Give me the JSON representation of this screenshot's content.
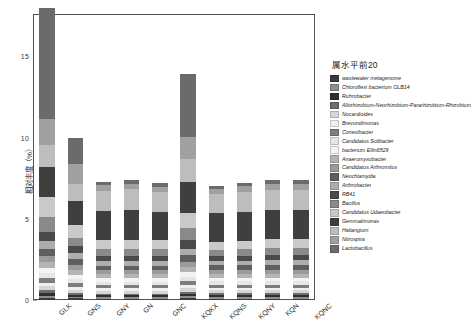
{
  "figure": {
    "background": "#ffffff",
    "frame_color": "#55524e"
  },
  "axes": {
    "y_label": "相对丰度（%）",
    "y_ticks": [
      "0",
      "5",
      "10",
      "15"
    ],
    "x_label": ""
  },
  "legend": {
    "title": "属水平前20",
    "position": "right"
  },
  "chart_data": {
    "type": "bar",
    "stacked": true,
    "title": "",
    "xlabel": "",
    "ylabel": "相对丰度（%）",
    "ylim": [
      0,
      17.6
    ],
    "yticks": [
      0,
      5,
      10,
      15
    ],
    "grid": false,
    "legend_title": "属水平前20",
    "legend_position": "right",
    "categories": [
      "GLK",
      "GNS",
      "GNY",
      "GN",
      "GNC",
      "KQKX",
      "KQNS",
      "KQNY",
      "KQN",
      "KQNC"
    ],
    "totals": [
      17.1,
      9.9,
      7.1,
      7.2,
      7.0,
      12.9,
      6.6,
      6.7,
      7.0,
      7.0
    ],
    "series": [
      {
        "name": "wastewater metagenome",
        "color": "#3a3a3a",
        "values": [
          0.12,
          0.1,
          0.08,
          0.08,
          0.08,
          0.11,
          0.09,
          0.09,
          0.09,
          0.09
        ]
      },
      {
        "name": "Chloroflexi bacterium OLB14",
        "color": "#8e8e8e",
        "values": [
          0.14,
          0.1,
          0.09,
          0.09,
          0.09,
          0.12,
          0.1,
          0.1,
          0.1,
          0.1
        ]
      },
      {
        "name": "Ruhrobacter",
        "color": "#2f2f2f",
        "values": [
          0.16,
          0.11,
          0.11,
          0.11,
          0.11,
          0.13,
          0.11,
          0.11,
          0.11,
          0.11
        ]
      },
      {
        "name": "Allorhizobium-Neorhizobium-Pararhizobium-Rhizobium",
        "color": "#6d6d6d",
        "values": [
          0.18,
          0.13,
          0.12,
          0.12,
          0.12,
          0.15,
          0.13,
          0.13,
          0.13,
          0.13
        ]
      },
      {
        "name": "Nocardioides",
        "color": "#d6d6d6",
        "values": [
          0.26,
          0.2,
          0.17,
          0.17,
          0.17,
          0.22,
          0.17,
          0.17,
          0.17,
          0.17
        ]
      },
      {
        "name": "Brevundimonas",
        "color": "#efefef",
        "values": [
          0.22,
          0.18,
          0.16,
          0.16,
          0.16,
          0.2,
          0.16,
          0.16,
          0.16,
          0.16
        ]
      },
      {
        "name": "Conexibacter",
        "color": "#7d7d7d",
        "values": [
          0.28,
          0.22,
          0.19,
          0.19,
          0.19,
          0.24,
          0.19,
          0.19,
          0.19,
          0.19
        ]
      },
      {
        "name": "Candidatus Solibacter",
        "color": "#e6e6e6",
        "values": [
          0.3,
          0.24,
          0.2,
          0.2,
          0.2,
          0.26,
          0.2,
          0.2,
          0.2,
          0.2
        ]
      },
      {
        "name": "bacterium Ellin6529",
        "color": "#f3f3f3",
        "values": [
          0.32,
          0.26,
          0.22,
          0.22,
          0.22,
          0.28,
          0.22,
          0.22,
          0.22,
          0.22
        ]
      },
      {
        "name": "Anaeromyxobacter",
        "color": "#b4b4b4",
        "values": [
          0.36,
          0.3,
          0.24,
          0.24,
          0.24,
          0.32,
          0.24,
          0.24,
          0.24,
          0.24
        ]
      },
      {
        "name": "Candidatus Arthromitus",
        "color": "#9b9b9b",
        "values": [
          0.38,
          0.32,
          0.26,
          0.26,
          0.26,
          0.34,
          0.26,
          0.26,
          0.26,
          0.26
        ]
      },
      {
        "name": "Neochlamydia",
        "color": "#5f5f5f",
        "values": [
          0.42,
          0.34,
          0.27,
          0.27,
          0.27,
          0.38,
          0.26,
          0.27,
          0.27,
          0.27
        ]
      },
      {
        "name": "Arthrobacter",
        "color": "#adadad",
        "values": [
          0.48,
          0.38,
          0.3,
          0.3,
          0.3,
          0.42,
          0.28,
          0.29,
          0.3,
          0.3
        ]
      },
      {
        "name": "RB41",
        "color": "#4a4a4a",
        "values": [
          0.6,
          0.42,
          0.32,
          0.32,
          0.32,
          0.52,
          0.3,
          0.31,
          0.32,
          0.32
        ]
      },
      {
        "name": "Bacillus",
        "color": "#8a8a8a",
        "values": [
          0.9,
          0.55,
          0.42,
          0.42,
          0.42,
          0.72,
          0.38,
          0.4,
          0.42,
          0.42
        ]
      },
      {
        "name": "Candidatus Udaeobacter",
        "color": "#c9c9c9",
        "values": [
          1.25,
          0.78,
          0.56,
          0.58,
          0.56,
          0.95,
          0.5,
          0.52,
          0.56,
          0.56
        ]
      },
      {
        "name": "Gemmatimonas",
        "color": "#3f3f3f",
        "values": [
          1.85,
          1.45,
          1.75,
          1.8,
          1.7,
          1.9,
          1.75,
          1.78,
          1.8,
          1.8
        ]
      },
      {
        "name": "Haliangium",
        "color": "#bdbdbd",
        "values": [
          1.3,
          1.05,
          1.25,
          1.28,
          1.22,
          1.45,
          1.22,
          1.24,
          1.26,
          1.26
        ]
      },
      {
        "name": "Nitrospira",
        "color": "#a0a0a0",
        "values": [
          1.6,
          1.25,
          0.35,
          0.36,
          0.34,
          1.3,
          0.3,
          0.32,
          0.34,
          0.34
        ]
      },
      {
        "name": "Lactobacillus",
        "color": "#6b6b6b",
        "values": [
          6.88,
          1.61,
          0.24,
          0.23,
          0.23,
          3.89,
          0.14,
          0.2,
          0.26,
          0.26
        ]
      }
    ]
  }
}
